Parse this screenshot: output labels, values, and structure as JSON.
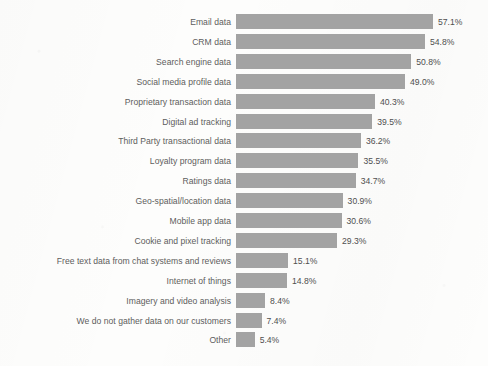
{
  "chart_data": {
    "type": "bar",
    "orientation": "horizontal",
    "title": "",
    "subtitle": "",
    "xlabel": "",
    "ylabel": "",
    "grid": false,
    "legend": "none",
    "xlim": [
      0,
      57.1
    ],
    "value_suffix": "%",
    "bar_color": "#a3a3a3",
    "label_color": "#5d5d5d",
    "value_color": "#4f4f4f",
    "background_color": "#fdfdfc",
    "categories": [
      "Email data",
      "CRM data",
      "Search engine data",
      "Social media profile data",
      "Proprietary transaction data",
      "Digital ad tracking",
      "Third Party transactional data",
      "Loyalty program data",
      "Ratings data",
      "Geo-spatial/location data",
      "Mobile app data",
      "Cookie and pixel tracking",
      "Free text data from chat systems and reviews",
      "Internet of things",
      "Imagery and video analysis",
      "We do not gather data on our customers",
      "Other"
    ],
    "values": [
      57.1,
      54.8,
      50.8,
      49.0,
      40.3,
      39.5,
      36.2,
      35.5,
      34.7,
      30.9,
      30.6,
      29.3,
      15.1,
      14.8,
      8.4,
      7.4,
      5.4
    ],
    "value_labels": [
      "57.1%",
      "54.8%",
      "50.8%",
      "49.0%",
      "40.3%",
      "39.5%",
      "36.2%",
      "35.5%",
      "34.7%",
      "30.9%",
      "30.6%",
      "29.3%",
      "15.1%",
      "14.8%",
      "8.4%",
      "7.4%",
      "5.4%"
    ]
  },
  "layout": {
    "bar_origin_x": 236,
    "px_per_percent": 3.45,
    "first_row_top": 14,
    "row_pitch": 19.9,
    "bar_height": 15,
    "value_gap": 5
  }
}
